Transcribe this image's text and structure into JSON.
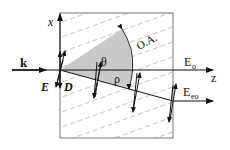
{
  "diagram": {
    "type": "birefringence-walkoff",
    "labels": {
      "wave_vector": "k",
      "x_axis": "x",
      "z_axis": "z",
      "optic_axis": "O.A.",
      "theta": "θ",
      "rho": "ρ",
      "field_E": "E",
      "field_D": "D",
      "ordinary": "E",
      "ordinary_sub": "o",
      "extraordinary": "E",
      "extraordinary_sub": "eo"
    },
    "colors": {
      "line": "#111111",
      "sector_fill": "#c8c8c8",
      "hatch": "#b0b0b0",
      "box": "#555555"
    }
  }
}
